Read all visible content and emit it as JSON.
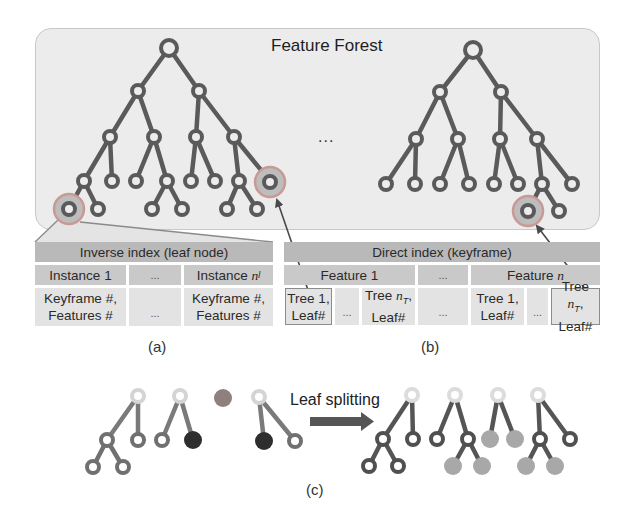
{
  "forest": {
    "title": "Feature Forest",
    "ellipsis": "..."
  },
  "inverse_index": {
    "header": "Inverse index (leaf node)",
    "columns": [
      {
        "label": "Instance 1",
        "value_line1": "Keyframe #,",
        "value_line2": "Features #"
      },
      {
        "label": "...",
        "value_line1": "",
        "value_line2": "..."
      },
      {
        "label": "Instance ",
        "label_sub": "n",
        "label_subscript": "l",
        "value_line1": "Keyframe #,",
        "value_line2": "Features #"
      }
    ],
    "caption": "(a)"
  },
  "direct_index": {
    "header": "Direct index (keyframe)",
    "features": [
      {
        "label": "Feature 1"
      },
      {
        "label": "..."
      },
      {
        "label": "Feature ",
        "label_var": "n"
      }
    ],
    "leaves": [
      {
        "line1": "Tree 1,",
        "line2": "Leaf#",
        "outlined": true
      },
      {
        "line1": "",
        "line2": "..."
      },
      {
        "line1": "Tree ",
        "var": "n",
        "sub": "T",
        "line1_suffix": ",",
        "line2": "Leaf#"
      },
      {
        "line1": "",
        "line2": "..."
      },
      {
        "line1": "Tree 1,",
        "line2": "Leaf#"
      },
      {
        "line1": "",
        "line2": "..."
      },
      {
        "line1": "Tree ",
        "var": "n",
        "sub": "T",
        "line1_suffix": ",",
        "line2": "Leaf#",
        "outlined": true
      }
    ],
    "caption": "(b)"
  },
  "leaf_splitting": {
    "label": "Leaf splitting",
    "caption": "(c)"
  },
  "colors": {
    "node_stroke": "#5a5a5a",
    "edge": "#5a5a5a",
    "highlight_ring": "#c99a93",
    "highlight_fill": "#bdbdbd",
    "dark_leaf": "#2e2e2e",
    "light_leaf": "#a8a8a8",
    "faded_root": "#dcdcdc",
    "forest_bg": "#ececec",
    "header_bg": "#b9b9b9",
    "subheader_bg": "#c9c9c9",
    "cell_bg": "#e3e3e3"
  }
}
